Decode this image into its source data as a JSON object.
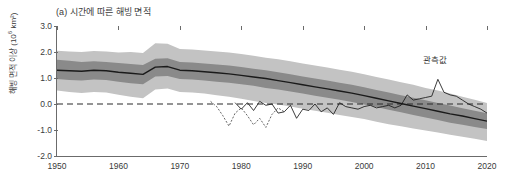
{
  "chart_data": {
    "type": "area",
    "title": "(a) 시간에 따른 해빙 면적",
    "xlabel": "",
    "ylabel": "해빙 면적 이상 (10⁶ km²)",
    "ylabel_base": "해빙 면적 이상 (10",
    "ylabel_exp": "6",
    "ylabel_tail": " km²)",
    "xlim": [
      1950,
      2020
    ],
    "ylim": [
      -2.0,
      3.0
    ],
    "grid": false,
    "legend_position": "inline-annotation",
    "xticks": [
      1950,
      1960,
      1970,
      1980,
      1990,
      2000,
      2010,
      2020
    ],
    "xtick_labels": [
      "1950",
      "1960",
      "1970",
      "1980",
      "1990",
      "2000",
      "2010",
      "2020"
    ],
    "yticks": [
      3.0,
      2.0,
      1.0,
      0.0,
      -1.0,
      -2.0
    ],
    "ytick_labels": [
      "3.0",
      "2.0",
      "1.0",
      "0.0",
      "-1.0",
      "-2.0"
    ],
    "colors": {
      "outer_band": "#c3c3c3",
      "inner_band": "#8a8a8a",
      "model_mean": "#1a1a1a",
      "observation": "#1a1a1a",
      "zero_line": "#2a2a2a",
      "axis": "#6b6b6b"
    },
    "annotations": [
      {
        "text": "관측값",
        "x": 2011.5,
        "y": 1.75,
        "name": "observation-annotation"
      }
    ],
    "zero_reference_line": 0.0,
    "series": [
      {
        "name": "outer_band_upper",
        "kind": "band-edge",
        "x": [
          1950,
          1952,
          1954,
          1956,
          1958,
          1960,
          1962,
          1964,
          1966,
          1968,
          1970,
          1972,
          1974,
          1976,
          1978,
          1980,
          1982,
          1984,
          1986,
          1988,
          1990,
          1992,
          1994,
          1996,
          1998,
          2000,
          2002,
          2004,
          2006,
          2008,
          2010,
          2012,
          2014,
          2016,
          2018,
          2020
        ],
        "values": [
          2.05,
          2.02,
          2.0,
          2.04,
          2.02,
          1.98,
          2.0,
          1.96,
          2.34,
          2.32,
          2.12,
          2.1,
          2.06,
          2.02,
          1.98,
          1.92,
          1.86,
          1.78,
          1.72,
          1.64,
          1.56,
          1.48,
          1.4,
          1.32,
          1.24,
          1.14,
          1.04,
          0.94,
          0.84,
          0.74,
          0.62,
          0.52,
          0.4,
          0.28,
          0.16,
          0.04
        ]
      },
      {
        "name": "outer_band_lower",
        "kind": "band-edge",
        "x": [
          1950,
          1952,
          1954,
          1956,
          1958,
          1960,
          1962,
          1964,
          1966,
          1968,
          1970,
          1972,
          1974,
          1976,
          1978,
          1980,
          1982,
          1984,
          1986,
          1988,
          1990,
          1992,
          1994,
          1996,
          1998,
          2000,
          2002,
          2004,
          2006,
          2008,
          2010,
          2012,
          2014,
          2016,
          2018,
          2020
        ],
        "values": [
          0.52,
          0.46,
          0.42,
          0.46,
          0.44,
          0.36,
          0.28,
          0.22,
          0.56,
          0.6,
          0.46,
          0.44,
          0.4,
          0.34,
          0.28,
          0.2,
          0.12,
          0.04,
          -0.02,
          -0.1,
          -0.18,
          -0.26,
          -0.34,
          -0.42,
          -0.5,
          -0.58,
          -0.68,
          -0.78,
          -0.86,
          -0.94,
          -1.02,
          -1.1,
          -1.18,
          -1.26,
          -1.34,
          -1.42
        ]
      },
      {
        "name": "inner_band_upper",
        "kind": "band-edge",
        "x": [
          1950,
          1952,
          1954,
          1956,
          1958,
          1960,
          1962,
          1964,
          1966,
          1968,
          1970,
          1972,
          1974,
          1976,
          1978,
          1980,
          1982,
          1984,
          1986,
          1988,
          1990,
          1992,
          1994,
          1996,
          1998,
          2000,
          2002,
          2004,
          2006,
          2008,
          2010,
          2012,
          2014,
          2016,
          2018,
          2020
        ],
        "values": [
          1.7,
          1.66,
          1.62,
          1.64,
          1.62,
          1.58,
          1.54,
          1.5,
          1.74,
          1.76,
          1.62,
          1.6,
          1.56,
          1.52,
          1.48,
          1.42,
          1.36,
          1.3,
          1.22,
          1.14,
          1.06,
          0.98,
          0.9,
          0.82,
          0.74,
          0.64,
          0.54,
          0.44,
          0.34,
          0.24,
          0.14,
          0.04,
          -0.06,
          -0.16,
          -0.26,
          -0.36
        ]
      },
      {
        "name": "inner_band_lower",
        "kind": "band-edge",
        "x": [
          1950,
          1952,
          1954,
          1956,
          1958,
          1960,
          1962,
          1964,
          1966,
          1968,
          1970,
          1972,
          1974,
          1976,
          1978,
          1980,
          1982,
          1984,
          1986,
          1988,
          1990,
          1992,
          1994,
          1996,
          1998,
          2000,
          2002,
          2004,
          2006,
          2008,
          2010,
          2012,
          2014,
          2016,
          2018,
          2020
        ],
        "values": [
          0.96,
          0.92,
          0.9,
          0.94,
          0.92,
          0.86,
          0.8,
          0.76,
          1.06,
          1.08,
          0.96,
          0.94,
          0.9,
          0.86,
          0.82,
          0.76,
          0.7,
          0.62,
          0.56,
          0.48,
          0.4,
          0.32,
          0.24,
          0.16,
          0.08,
          -0.02,
          -0.12,
          -0.22,
          -0.32,
          -0.42,
          -0.52,
          -0.62,
          -0.72,
          -0.8,
          -0.88,
          -0.96
        ]
      },
      {
        "name": "model_mean",
        "kind": "line",
        "x": [
          1950,
          1952,
          1954,
          1956,
          1958,
          1960,
          1962,
          1964,
          1966,
          1968,
          1970,
          1972,
          1974,
          1976,
          1978,
          1980,
          1982,
          1984,
          1986,
          1988,
          1990,
          1992,
          1994,
          1996,
          1998,
          2000,
          2002,
          2004,
          2006,
          2008,
          2010,
          2012,
          2014,
          2016,
          2018,
          2020
        ],
        "values": [
          1.3,
          1.28,
          1.26,
          1.3,
          1.28,
          1.22,
          1.18,
          1.14,
          1.42,
          1.44,
          1.3,
          1.28,
          1.24,
          1.2,
          1.16,
          1.1,
          1.04,
          0.98,
          0.9,
          0.82,
          0.74,
          0.66,
          0.58,
          0.5,
          0.42,
          0.32,
          0.22,
          0.12,
          0.02,
          -0.08,
          -0.18,
          -0.28,
          -0.38,
          -0.46,
          -0.56,
          -0.66
        ]
      },
      {
        "name": "observation_early_dotted",
        "kind": "line-dotted",
        "x": [
          1975,
          1976,
          1977,
          1978,
          1979,
          1980,
          1981,
          1982,
          1983,
          1984,
          1985,
          1986,
          1987
        ],
        "values": [
          0.1,
          -0.1,
          -0.45,
          -0.85,
          -0.35,
          -0.15,
          -0.45,
          -0.8,
          -0.55,
          -0.9,
          -0.4,
          -0.15,
          -0.3
        ]
      },
      {
        "name": "observation",
        "kind": "line-thin",
        "x": [
          1979,
          1980,
          1981,
          1982,
          1983,
          1984,
          1985,
          1986,
          1987,
          1988,
          1989,
          1990,
          1991,
          1992,
          1993,
          1994,
          1995,
          1996,
          1997,
          1998,
          1999,
          2000,
          2001,
          2002,
          2003,
          2004,
          2005,
          2006,
          2007,
          2008,
          2009,
          2010,
          2011,
          2012,
          2013,
          2014,
          2015,
          2016,
          2017,
          2018,
          2019,
          2020
        ],
        "values": [
          0.05,
          -0.2,
          0.05,
          -0.25,
          0.1,
          -0.05,
          0.0,
          -0.35,
          -0.3,
          -0.05,
          -0.55,
          -0.2,
          -0.25,
          0.0,
          -0.3,
          -0.15,
          -0.4,
          0.05,
          -0.1,
          -0.15,
          -0.2,
          -0.1,
          -0.05,
          -0.15,
          -0.1,
          -0.05,
          -0.15,
          -0.05,
          0.35,
          0.15,
          0.2,
          0.25,
          0.3,
          0.95,
          0.45,
          0.35,
          0.3,
          0.15,
          0.0,
          -0.1,
          -0.2,
          -0.35
        ]
      }
    ]
  }
}
